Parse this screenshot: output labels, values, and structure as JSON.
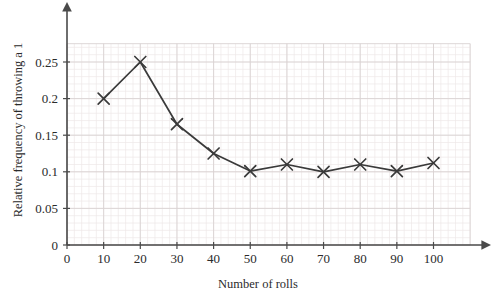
{
  "chart_data": {
    "type": "line",
    "title": "",
    "xlabel": "Number of rolls",
    "ylabel": "Relative frequency of throwing a 1",
    "x": [
      10,
      20,
      30,
      40,
      50,
      60,
      70,
      80,
      90,
      100
    ],
    "values": [
      0.2,
      0.25,
      0.165,
      0.125,
      0.101,
      0.11,
      0.1,
      0.11,
      0.101,
      0.112
    ],
    "series": [
      {
        "name": "Relative frequency of throwing a 1",
        "values": [
          0.2,
          0.25,
          0.165,
          0.125,
          0.101,
          0.11,
          0.1,
          0.11,
          0.101,
          0.112
        ]
      }
    ],
    "xlim": [
      0,
      110
    ],
    "ylim": [
      0,
      0.275
    ],
    "xticks": [
      0,
      10,
      20,
      30,
      40,
      50,
      60,
      70,
      80,
      90,
      100
    ],
    "xtick_labels": [
      "0",
      "10",
      "20",
      "30",
      "40",
      "50",
      "60",
      "70",
      "80",
      "90",
      "100"
    ],
    "yticks": [
      0,
      0.05,
      0.1,
      0.15,
      0.2,
      0.25
    ],
    "ytick_labels": [
      "0",
      "0.05",
      "0.1",
      "0.15",
      "0.2",
      "0.25"
    ],
    "grid": true,
    "minor_grid": true,
    "minor_grid_divisions": 5,
    "legend": null,
    "marker": "x",
    "line_color": "#3a3a3a",
    "marker_color": "#3a3a3a",
    "major_grid_color": "#d9d2d2",
    "minor_grid_color": "#eee8e8",
    "axis_color": "#4a4a4a",
    "background_color": "#ffffff",
    "annotations": []
  }
}
